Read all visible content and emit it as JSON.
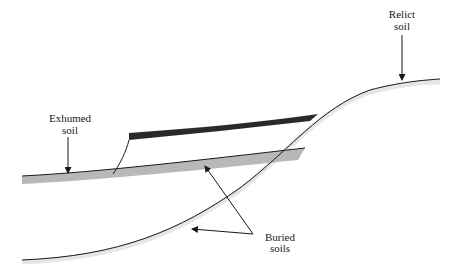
{
  "diagram": {
    "type": "soil-landscape cross-section",
    "labels": {
      "exhumed": [
        "Exhumed",
        "soil"
      ],
      "relict": [
        "Relict",
        "soil"
      ],
      "buried": [
        "Buried",
        "soils"
      ]
    },
    "colors": {
      "buried_dark_soil": "#2a2a2a",
      "exhumed_gray_soil": "#b8b8b8",
      "line": "#1a1a1a",
      "shadow": "#e4e4e4"
    }
  }
}
